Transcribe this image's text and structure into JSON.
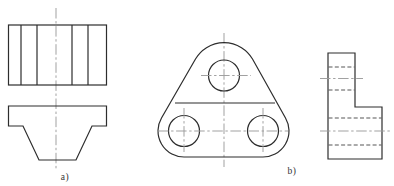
{
  "figure": {
    "type": "engineering-orthographic-views",
    "labels": {
      "a": "a)",
      "b": "b)"
    },
    "colors": {
      "background": "#ffffff",
      "outline": "#2d2d2d",
      "hidden": "#4d4d4d",
      "center": "#9c9c9c",
      "label": "#333333"
    },
    "line_styles": {
      "outline": {
        "color": "#2d2d2d",
        "width": 1.2,
        "dash": ""
      },
      "hidden": {
        "color": "#4d4d4d",
        "width": 0.95,
        "dash": "4 2.3"
      },
      "center": {
        "color": "#9c9c9c",
        "width": 0.95,
        "dash": "10.5 2.6 2.4 2.6"
      }
    }
  },
  "drawing": {
    "width": 394,
    "height": 186,
    "shapes": [
      {
        "name": "view-a-centerline",
        "type": "line",
        "stroke": "center",
        "x1": 56,
        "y1": 8,
        "x2": 56,
        "y2": 170
      },
      {
        "name": "view-a-top-outline",
        "type": "rect",
        "stroke": "outline",
        "x": 8.5,
        "y": 25,
        "w": 98,
        "h": 60
      },
      {
        "name": "view-a-top-divider-1",
        "type": "line",
        "stroke": "outline",
        "x1": 21,
        "y1": 25,
        "x2": 21,
        "y2": 85
      },
      {
        "name": "view-a-top-divider-2",
        "type": "line",
        "stroke": "outline",
        "x1": 37,
        "y1": 25,
        "x2": 37,
        "y2": 85
      },
      {
        "name": "view-a-top-divider-3",
        "type": "line",
        "stroke": "outline",
        "x1": 72,
        "y1": 25,
        "x2": 72,
        "y2": 85
      },
      {
        "name": "view-a-top-divider-4",
        "type": "line",
        "stroke": "outline",
        "x1": 88,
        "y1": 25,
        "x2": 88,
        "y2": 85
      },
      {
        "name": "view-a-front-outline",
        "type": "path",
        "stroke": "outline",
        "d": "M8.5 106 L106.5 106 L106.5 126 L92 126 L76 160 L39 160 L23 126 L8.5 126 Z"
      },
      {
        "name": "view-b-centerline-vertical",
        "type": "line",
        "stroke": "center",
        "x1": 224,
        "y1": 33,
        "x2": 224,
        "y2": 167
      },
      {
        "name": "view-b-plate-outline",
        "type": "path",
        "stroke": "outline",
        "d": "M195.5 59 A33 33 0 0 1 252.5 59 L285.5 118 A26 26 0 0 1 263 157 L184 157 A26 26 0 0 1 161.5 118 Z"
      },
      {
        "name": "view-b-edge-line",
        "type": "line",
        "stroke": "outline",
        "x1": 175,
        "y1": 103,
        "x2": 275,
        "y2": 103
      },
      {
        "name": "view-b-top-hole",
        "type": "circle",
        "stroke": "outline",
        "cx": 224,
        "cy": 75.5,
        "r": 15.5
      },
      {
        "name": "view-b-left-hole",
        "type": "circle",
        "stroke": "outline",
        "cx": 184,
        "cy": 131,
        "r": 15.5
      },
      {
        "name": "view-b-right-hole",
        "type": "circle",
        "stroke": "outline",
        "cx": 263,
        "cy": 131,
        "r": 15.5
      },
      {
        "name": "view-b-top-hole-centerline",
        "type": "line",
        "stroke": "center",
        "x1": 201,
        "y1": 75.5,
        "x2": 251,
        "y2": 75.5
      },
      {
        "name": "view-b-bottom-holes-centerline",
        "type": "line",
        "stroke": "center",
        "x1": 158,
        "y1": 131,
        "x2": 288,
        "y2": 131
      },
      {
        "name": "view-b-left-hole-centerline",
        "type": "line",
        "stroke": "center",
        "x1": 184,
        "y1": 108,
        "x2": 184,
        "y2": 152
      },
      {
        "name": "view-b-right-hole-centerline",
        "type": "line",
        "stroke": "center",
        "x1": 263,
        "y1": 108,
        "x2": 263,
        "y2": 152
      },
      {
        "name": "side-view-outline",
        "type": "path",
        "stroke": "outline",
        "d": "M328 53 L355 53 L355 107 L382 107 L382 159 L328 159 Z"
      },
      {
        "name": "side-view-hidden-top-1",
        "type": "line",
        "stroke": "hidden",
        "x1": 328.5,
        "y1": 67,
        "x2": 354.5,
        "y2": 67
      },
      {
        "name": "side-view-hidden-top-2",
        "type": "line",
        "stroke": "hidden",
        "x1": 328.5,
        "y1": 90,
        "x2": 354.5,
        "y2": 90
      },
      {
        "name": "side-view-hidden-bottom-1",
        "type": "line",
        "stroke": "hidden",
        "x1": 328.5,
        "y1": 118,
        "x2": 381.5,
        "y2": 118
      },
      {
        "name": "side-view-hidden-bottom-2",
        "type": "line",
        "stroke": "hidden",
        "x1": 328.5,
        "y1": 145,
        "x2": 381.5,
        "y2": 145
      },
      {
        "name": "side-view-centerline-top",
        "type": "line",
        "stroke": "center",
        "x1": 320,
        "y1": 78.5,
        "x2": 363,
        "y2": 78.5
      },
      {
        "name": "side-view-centerline-bottom",
        "type": "line",
        "stroke": "center",
        "x1": 320,
        "y1": 131,
        "x2": 390,
        "y2": 131
      }
    ]
  }
}
